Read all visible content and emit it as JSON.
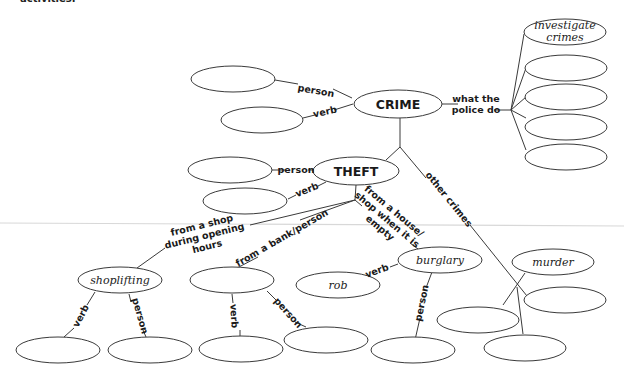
{
  "page": {
    "cutoff_heading": "activities."
  },
  "diagram": {
    "type": "word-map",
    "root": {
      "label": "CRIME",
      "branches": {
        "person": {
          "edge_label": "person",
          "answer": ""
        },
        "verb": {
          "edge_label": "verb",
          "answer": ""
        },
        "police": {
          "edge_label_line1": "what the",
          "edge_label_line2": "police do",
          "answers": [
            {
              "line1": "investigate",
              "line2": "crimes"
            },
            {
              "line1": "",
              "line2": ""
            },
            {
              "line1": "",
              "line2": ""
            },
            {
              "line1": "",
              "line2": ""
            },
            {
              "line1": "",
              "line2": ""
            }
          ]
        },
        "other_crimes": {
          "edge_label": "other crimes",
          "answers": [
            "murder",
            "",
            "",
            ""
          ]
        }
      }
    },
    "theft": {
      "label": "THEFT",
      "person": {
        "edge_label": "person",
        "answer": ""
      },
      "verb": {
        "edge_label": "verb",
        "answer": ""
      },
      "shop": {
        "edge_label_line1": "from a shop",
        "edge_label_line2": "during opening",
        "edge_label_line3": "hours",
        "answer": "shoplifting",
        "verb": {
          "edge_label": "verb",
          "answer": ""
        },
        "person": {
          "edge_label": "person",
          "answer": ""
        }
      },
      "bank": {
        "edge_label": "from a bank/person",
        "answer": "",
        "verb": {
          "edge_label": "verb",
          "answer": ""
        },
        "person": {
          "edge_label": "person",
          "answer": ""
        }
      },
      "house": {
        "edge_label_line1": "from a house/",
        "edge_label_line2": "shop when it is",
        "edge_label_line3": "empty",
        "answer": "burglary",
        "verb": {
          "edge_label": "verb",
          "answer": "rob"
        },
        "person": {
          "edge_label": "person",
          "answer": ""
        }
      }
    }
  }
}
